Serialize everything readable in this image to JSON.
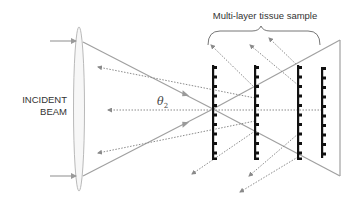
{
  "diagram": {
    "title": "Multi-layer tissue sample",
    "incident_label_line1": "INCIDENT",
    "incident_label_line2": "BEAM",
    "angle_symbol": "θ",
    "angle_subscript": "2",
    "colors": {
      "beam": "#a0a0a0",
      "scatter": "#8a8a8a",
      "layers": "#111111",
      "lens": "#9a9a9a",
      "text": "#333333"
    },
    "layers_x": [
      213,
      255,
      298,
      322
    ],
    "focal_point": [
      213,
      109
    ]
  }
}
